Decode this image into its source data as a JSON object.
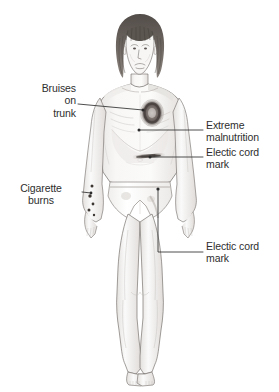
{
  "illustration": {
    "title": "Child physical abuse findings",
    "subject": "malnourished child standing frontal view",
    "style": "grayscale pencil medical illustration",
    "background_color": "#ffffff",
    "line_color": "#3a3a3a",
    "skin_tone": "#f6f5f4",
    "hair_color": "#4a4542",
    "lesion_color": "#6d6663"
  },
  "callouts": [
    {
      "id": "bruises-on-trunk",
      "text": "Bruises\non\ntrunk",
      "align": "right",
      "side": "left",
      "target": "ring-shaped bruise on upper left chest"
    },
    {
      "id": "cigarette-burns",
      "text": "Cigarette\nburns",
      "align": "center",
      "side": "left",
      "target": "small round burns on right forearm"
    },
    {
      "id": "extreme-malnutrition",
      "text": "Extreme\nmalnutrition",
      "align": "left",
      "side": "right",
      "target": "wasted torso with visible ribs"
    },
    {
      "id": "electic-cord-mark-upper",
      "text": "Electic cord\nmark",
      "align": "left",
      "side": "right",
      "target": "linear mark across lower abdomen"
    },
    {
      "id": "electic-cord-mark-lower",
      "text": "Electic cord\nmark",
      "align": "left",
      "side": "right",
      "target": "linear mark on left thigh"
    }
  ],
  "findings": [
    {
      "name": "ring-bruise-chest",
      "region": "upper chest"
    },
    {
      "name": "rib-wasting",
      "region": "mid torso"
    },
    {
      "name": "cord-mark-abdomen",
      "region": "lower abdomen"
    },
    {
      "name": "cigarette-burn-dots",
      "region": "right forearm"
    },
    {
      "name": "cord-mark-thigh",
      "region": "left upper thigh"
    }
  ]
}
